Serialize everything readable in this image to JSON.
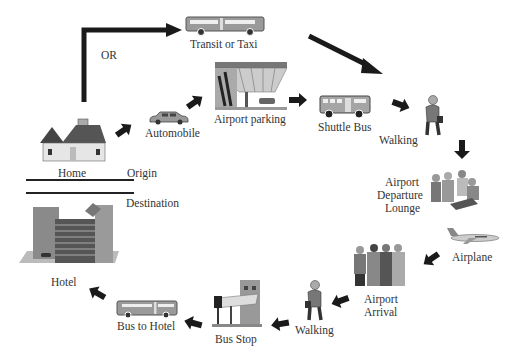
{
  "diagram": {
    "type": "travel-chain-flow",
    "labels": {
      "or": "OR",
      "transit": "Transit or Taxi",
      "automobile": "Automobile",
      "airport_parking": "Airport parking",
      "shuttle_bus": "Shuttle Bus",
      "walking_1": "Walking",
      "departure_lounge_1": "Airport",
      "departure_lounge_2": "Departure",
      "departure_lounge_3": "Lounge",
      "airplane": "Airplane",
      "arrival_1": "Airport",
      "arrival_2": "Arrival",
      "walking_2": "Walking",
      "bus_stop": "Bus Stop",
      "bus_to_hotel": "Bus to Hotel",
      "hotel": "Hotel",
      "home": "Home",
      "origin": "Origin",
      "destination": "Destination"
    },
    "nodes": [
      {
        "id": "home",
        "label": "Home",
        "icon": "house-icon"
      },
      {
        "id": "transit",
        "label": "Transit or Taxi",
        "icon": "bus-icon"
      },
      {
        "id": "automobile",
        "label": "Automobile",
        "icon": "car-icon"
      },
      {
        "id": "airport_parking",
        "label": "Airport parking",
        "icon": "parking-garage-icon"
      },
      {
        "id": "shuttle_bus",
        "label": "Shuttle Bus",
        "icon": "shuttle-bus-icon"
      },
      {
        "id": "walking_1",
        "label": "Walking",
        "icon": "walking-person-icon"
      },
      {
        "id": "departure_lounge",
        "label": "Airport Departure Lounge",
        "icon": "lounge-people-icon"
      },
      {
        "id": "airplane",
        "label": "Airplane",
        "icon": "airplane-icon"
      },
      {
        "id": "arrival",
        "label": "Airport Arrival",
        "icon": "arrival-people-icon"
      },
      {
        "id": "walking_2",
        "label": "Walking",
        "icon": "walking-person-icon"
      },
      {
        "id": "bus_stop",
        "label": "Bus Stop",
        "icon": "bus-stop-icon"
      },
      {
        "id": "bus_to_hotel",
        "label": "Bus to Hotel",
        "icon": "bus-icon"
      },
      {
        "id": "hotel",
        "label": "Hotel",
        "icon": "hotel-building-icon"
      }
    ],
    "edges": [
      [
        "home",
        "transit"
      ],
      [
        "home",
        "automobile"
      ],
      [
        "automobile",
        "airport_parking"
      ],
      [
        "airport_parking",
        "shuttle_bus"
      ],
      [
        "transit",
        "walking_1"
      ],
      [
        "shuttle_bus",
        "walking_1"
      ],
      [
        "walking_1",
        "departure_lounge"
      ],
      [
        "airplane",
        "arrival"
      ],
      [
        "arrival",
        "walking_2"
      ],
      [
        "walking_2",
        "bus_stop"
      ],
      [
        "bus_stop",
        "bus_to_hotel"
      ],
      [
        "bus_to_hotel",
        "hotel"
      ]
    ]
  }
}
